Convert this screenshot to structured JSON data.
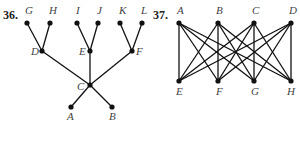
{
  "figures": [
    {
      "number": "36.",
      "type": "tree",
      "nodes": [
        {
          "id": "G",
          "x": 27,
          "y": 23,
          "lx": 25,
          "ly": 14
        },
        {
          "id": "H",
          "x": 50,
          "y": 23,
          "lx": 49,
          "ly": 14
        },
        {
          "id": "I",
          "x": 77,
          "y": 23,
          "lx": 76,
          "ly": 14
        },
        {
          "id": "J",
          "x": 98,
          "y": 23,
          "lx": 97,
          "ly": 14
        },
        {
          "id": "K",
          "x": 120,
          "y": 23,
          "lx": 119,
          "ly": 14
        },
        {
          "id": "L",
          "x": 142,
          "y": 23,
          "lx": 141,
          "ly": 14
        },
        {
          "id": "D",
          "x": 42,
          "y": 51,
          "lx": 31,
          "ly": 55
        },
        {
          "id": "E",
          "x": 90,
          "y": 51,
          "lx": 79,
          "ly": 55
        },
        {
          "id": "F",
          "x": 132,
          "y": 51,
          "lx": 136,
          "ly": 55
        },
        {
          "id": "C",
          "x": 90,
          "y": 85,
          "lx": 77,
          "ly": 90
        },
        {
          "id": "A",
          "x": 71,
          "y": 107,
          "lx": 67,
          "ly": 120
        },
        {
          "id": "B",
          "x": 112,
          "y": 107,
          "lx": 109,
          "ly": 120
        }
      ],
      "edges": [
        [
          "G",
          "D"
        ],
        [
          "H",
          "D"
        ],
        [
          "I",
          "E"
        ],
        [
          "J",
          "E"
        ],
        [
          "K",
          "F"
        ],
        [
          "L",
          "F"
        ],
        [
          "D",
          "C"
        ],
        [
          "E",
          "C"
        ],
        [
          "F",
          "C"
        ],
        [
          "C",
          "A"
        ],
        [
          "C",
          "B"
        ]
      ]
    },
    {
      "number": "37.",
      "type": "complete-bipartite K4,4",
      "nodes": [
        {
          "id": "A",
          "x": 179,
          "y": 23,
          "lx": 177,
          "ly": 14
        },
        {
          "id": "B",
          "x": 218,
          "y": 23,
          "lx": 216,
          "ly": 14
        },
        {
          "id": "C",
          "x": 254,
          "y": 23,
          "lx": 252,
          "ly": 14
        },
        {
          "id": "D",
          "x": 291,
          "y": 23,
          "lx": 289,
          "ly": 14
        },
        {
          "id": "E",
          "x": 179,
          "y": 81,
          "lx": 176,
          "ly": 95
        },
        {
          "id": "F",
          "x": 218,
          "y": 81,
          "lx": 216,
          "ly": 95
        },
        {
          "id": "G",
          "x": 254,
          "y": 81,
          "lx": 251,
          "ly": 95
        },
        {
          "id": "H",
          "x": 291,
          "y": 81,
          "lx": 287,
          "ly": 95
        }
      ],
      "edges": [
        [
          "A",
          "E"
        ],
        [
          "A",
          "F"
        ],
        [
          "A",
          "G"
        ],
        [
          "A",
          "H"
        ],
        [
          "B",
          "E"
        ],
        [
          "B",
          "F"
        ],
        [
          "B",
          "G"
        ],
        [
          "B",
          "H"
        ],
        [
          "C",
          "E"
        ],
        [
          "C",
          "F"
        ],
        [
          "C",
          "G"
        ],
        [
          "C",
          "H"
        ],
        [
          "D",
          "E"
        ],
        [
          "D",
          "F"
        ],
        [
          "D",
          "G"
        ],
        [
          "D",
          "H"
        ]
      ]
    }
  ],
  "labels": {
    "fig36_number": "36.",
    "fig37_number": "37."
  }
}
